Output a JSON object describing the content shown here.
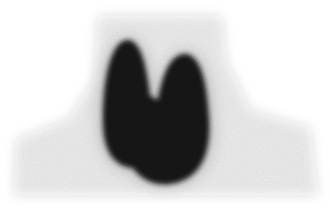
{
  "image": {
    "type": "thyroid scintigraphy scan",
    "background_color": "#ffffff",
    "uptake_color": "#121212",
    "background_activity_color": "#d6d6d6"
  }
}
